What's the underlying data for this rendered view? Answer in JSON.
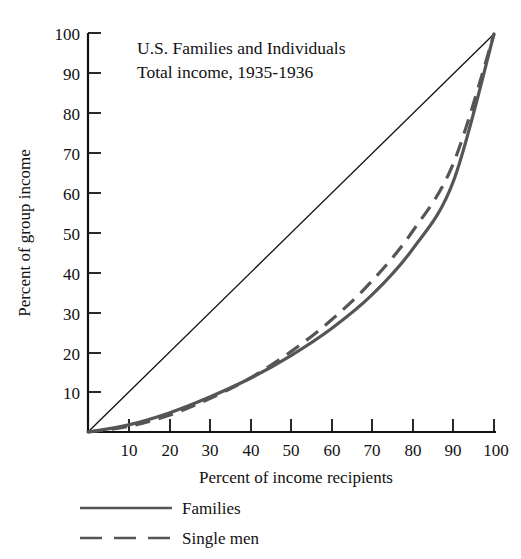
{
  "chart_data": {
    "type": "line",
    "title": "U.S. Families and Individuals",
    "subtitle": "Total income, 1935-1936",
    "xlabel": "Percent of income recipients",
    "ylabel": "Percent of group income",
    "xlim": [
      0,
      100
    ],
    "ylim": [
      0,
      100
    ],
    "grid": false,
    "legend_position": "below-axis",
    "x_ticks": [
      "10",
      "20",
      "30",
      "40",
      "50",
      "60",
      "70",
      "80",
      "90",
      "100"
    ],
    "x_tick_values": [
      10,
      20,
      30,
      40,
      50,
      60,
      70,
      80,
      90,
      100
    ],
    "y_ticks": [
      "10",
      "20",
      "30",
      "40",
      "50",
      "60",
      "70",
      "80",
      "90",
      "100"
    ],
    "y_tick_values": [
      10,
      20,
      30,
      40,
      50,
      60,
      70,
      80,
      90,
      100
    ],
    "x": [
      0,
      10,
      20,
      30,
      40,
      50,
      60,
      70,
      80,
      90,
      100
    ],
    "series": [
      {
        "name": "Families",
        "style": "solid",
        "color": "#555555",
        "values": [
          0,
          1.8,
          4.8,
          8.8,
          13.5,
          19.2,
          26.0,
          34.5,
          46.0,
          63.0,
          100
        ]
      },
      {
        "name": "Single men",
        "style": "dashed",
        "color": "#555555",
        "values": [
          0,
          1.4,
          4.2,
          8.4,
          13.6,
          20.2,
          28.2,
          38.0,
          50.5,
          67.5,
          100
        ]
      },
      {
        "name": "Line of equality",
        "style": "solid-thin",
        "color": "#111111",
        "values": [
          0,
          10,
          20,
          30,
          40,
          50,
          60,
          70,
          80,
          90,
          100
        ]
      }
    ],
    "annotations": []
  },
  "legend": {
    "items": [
      {
        "label": "Families",
        "style": "solid"
      },
      {
        "label": "Single men",
        "style": "dashed"
      }
    ]
  },
  "colors": {
    "curve": "#555555",
    "axis": "#111111",
    "background": "#ffffff"
  }
}
